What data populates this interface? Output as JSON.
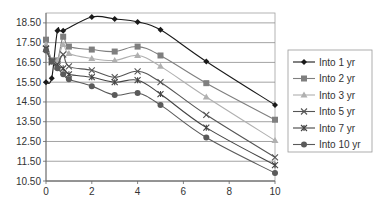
{
  "chart_data": {
    "type": "line",
    "title": "",
    "xlabel": "",
    "ylabel": "",
    "xlim": [
      0,
      10
    ],
    "ylim": [
      10.5,
      19.0
    ],
    "x_ticks": [
      0,
      2,
      4,
      6,
      8,
      10
    ],
    "x_tick_labels": [
      "0",
      "2",
      "4",
      "6",
      "8",
      "10"
    ],
    "y_ticks": [
      10.5,
      11.5,
      12.5,
      13.5,
      14.5,
      15.5,
      16.5,
      17.5,
      18.5
    ],
    "y_tick_labels": [
      "10.50",
      "11.50",
      "12.50",
      "13.50",
      "14.50",
      "15.50",
      "16.50",
      "17.50",
      "18.50"
    ],
    "grid": "horizontal",
    "legend_position": "right",
    "series": [
      {
        "name": "Into 1 yr",
        "marker": "diamond",
        "color": "#1a1a1a",
        "x": [
          0,
          0.25,
          0.5,
          0.75,
          2,
          3,
          4,
          5,
          7,
          10
        ],
        "values": [
          15.5,
          15.7,
          18.1,
          18.1,
          18.8,
          18.7,
          18.55,
          18.15,
          16.55,
          14.35
        ]
      },
      {
        "name": "Into 2 yr",
        "marker": "square",
        "color": "#7f7f7f",
        "x": [
          0,
          0.25,
          0.5,
          0.75,
          1,
          2,
          3,
          4,
          5,
          7,
          10
        ],
        "values": [
          17.65,
          16.6,
          16.6,
          17.8,
          17.3,
          17.15,
          17.05,
          17.3,
          16.85,
          15.45,
          13.6
        ]
      },
      {
        "name": "Into 3 yr",
        "marker": "triangle",
        "color": "#b0b0b0",
        "x": [
          0,
          0.25,
          0.5,
          0.75,
          1,
          2,
          3,
          4,
          5,
          7,
          10
        ],
        "values": [
          17.4,
          16.55,
          16.6,
          17.4,
          16.95,
          16.7,
          16.6,
          16.85,
          16.3,
          14.75,
          12.55
        ]
      },
      {
        "name": "Into 5 yr",
        "marker": "x",
        "color": "#555555",
        "x": [
          0,
          0.25,
          0.5,
          0.75,
          1,
          2,
          3,
          4,
          5,
          7,
          10
        ],
        "values": [
          17.2,
          16.5,
          16.4,
          16.9,
          16.3,
          16.1,
          15.75,
          16.05,
          15.5,
          13.85,
          11.7
        ]
      },
      {
        "name": "Into 7 yr",
        "marker": "star",
        "color": "#444444",
        "x": [
          0,
          0.25,
          0.5,
          0.75,
          1,
          2,
          3,
          4,
          5,
          7,
          10
        ],
        "values": [
          17.2,
          16.55,
          16.3,
          16.2,
          15.9,
          15.75,
          15.5,
          15.6,
          14.9,
          13.2,
          11.3
        ]
      },
      {
        "name": "Into 10 yr",
        "marker": "circle",
        "color": "#5a5a5a",
        "x": [
          0,
          0.25,
          0.5,
          0.75,
          1,
          2,
          3,
          4,
          5,
          7,
          10
        ],
        "values": [
          17.1,
          16.55,
          16.2,
          15.9,
          15.65,
          15.3,
          14.85,
          14.95,
          14.35,
          12.7,
          10.9
        ]
      }
    ]
  },
  "legend": {
    "items": [
      {
        "label": "Into 1 yr"
      },
      {
        "label": "Into 2 yr"
      },
      {
        "label": "Into 3 yr"
      },
      {
        "label": "Into 5 yr"
      },
      {
        "label": "Into 7 yr"
      },
      {
        "label": "Into 10 yr"
      }
    ]
  }
}
